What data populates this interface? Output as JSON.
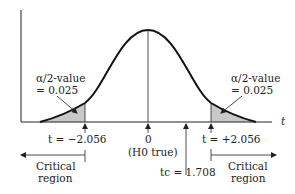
{
  "diagram": {
    "axis_label": "t",
    "colors": {
      "curve": "#111111",
      "shade": "#c8c8c8",
      "axis": "#222222",
      "text": "#222222"
    },
    "left_tail": {
      "label_line1": "α/2-value",
      "label_line2": "= 0.025",
      "critical_label": "t = −2.056",
      "region_line1": "Critical",
      "region_line2": "region"
    },
    "right_tail": {
      "label_line1": "α/2-value",
      "label_line2": "= 0.025",
      "critical_label": "t = +2.056",
      "region_line1": "Critical",
      "region_line2": "region"
    },
    "center": {
      "value": "0",
      "note": "(H0 true)"
    },
    "test_statistic": {
      "label": "tc = 1.708"
    }
  }
}
